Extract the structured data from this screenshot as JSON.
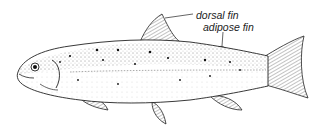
{
  "figure": {
    "labels": [
      {
        "id": "dorsal",
        "text": "dorsal fin"
      },
      {
        "id": "adipose",
        "text": "adipose fin"
      }
    ]
  },
  "colors": {
    "ink": "#1a1a1a",
    "background": "#ffffff"
  }
}
